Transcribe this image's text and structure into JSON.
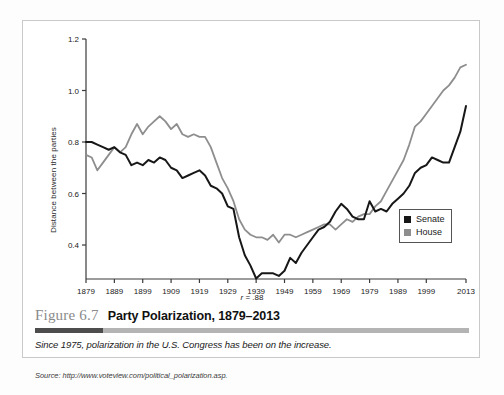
{
  "figure": {
    "number_label": "Figure 6.7",
    "title": "Party Polarization, 1879–2013",
    "subtitle": "Since 1975, polarization in the U.S. Congress has been on the increase.",
    "source": "Source: http://www.voteview.com/political_polarization.asp."
  },
  "legend": {
    "position": "inside-right",
    "items": [
      {
        "label": "Senate",
        "color": "#171717",
        "swatch_name": "senate-swatch"
      },
      {
        "label": "House",
        "color": "#8e8e8e",
        "swatch_name": "house-swatch"
      }
    ]
  },
  "annotation": {
    "correlation_prefix": "r",
    "correlation_equals": "= .88",
    "correlation_text": "r = .88"
  },
  "chart_data": {
    "type": "line",
    "title": "Party Polarization, 1879–2013",
    "subtitle": "Since 1975, polarization in the U.S. Congress has been on the increase.",
    "xlabel": "",
    "ylabel": "Distance between the parties",
    "xlim": [
      1879,
      2013
    ],
    "ylim": [
      0.27,
      1.2
    ],
    "grid": false,
    "legend_position": "inside-right",
    "axis": {
      "y_ticks": [
        0.4,
        0.6,
        0.8,
        1.0,
        1.2
      ],
      "y_tick_labels": [
        "0.4",
        "0.6",
        "0.8",
        "1.0",
        "1.2"
      ],
      "x_ticks": [
        1879,
        1889,
        1899,
        1909,
        1919,
        1929,
        1939,
        1949,
        1959,
        1969,
        1979,
        1989,
        1999,
        2013
      ],
      "x_tick_labels": [
        "1879",
        "1889",
        "1899",
        "1909",
        "1919",
        "1929",
        "1939",
        "1949",
        "1959",
        "1969",
        "1979",
        "1989",
        "1999",
        "2013"
      ]
    },
    "annotations": [
      {
        "text": "r = .88",
        "placement": "below-x-axis-center"
      }
    ],
    "x": [
      1879,
      1881,
      1883,
      1885,
      1887,
      1889,
      1891,
      1893,
      1895,
      1897,
      1899,
      1901,
      1903,
      1905,
      1907,
      1909,
      1911,
      1913,
      1915,
      1917,
      1919,
      1921,
      1923,
      1925,
      1927,
      1929,
      1931,
      1933,
      1935,
      1937,
      1939,
      1941,
      1943,
      1945,
      1947,
      1949,
      1951,
      1953,
      1955,
      1957,
      1959,
      1961,
      1963,
      1965,
      1967,
      1969,
      1971,
      1973,
      1975,
      1977,
      1979,
      1981,
      1983,
      1985,
      1987,
      1989,
      1991,
      1993,
      1995,
      1997,
      1999,
      2001,
      2003,
      2005,
      2007,
      2009,
      2011,
      2013
    ],
    "series": [
      {
        "name": "Senate",
        "color": "#171717",
        "values": [
          0.8,
          0.8,
          0.79,
          0.78,
          0.77,
          0.78,
          0.76,
          0.75,
          0.71,
          0.72,
          0.71,
          0.73,
          0.72,
          0.74,
          0.73,
          0.7,
          0.69,
          0.66,
          0.67,
          0.68,
          0.69,
          0.67,
          0.63,
          0.62,
          0.6,
          0.55,
          0.54,
          0.43,
          0.36,
          0.32,
          0.27,
          0.29,
          0.29,
          0.29,
          0.28,
          0.3,
          0.35,
          0.33,
          0.37,
          0.4,
          0.43,
          0.46,
          0.47,
          0.49,
          0.53,
          0.56,
          0.54,
          0.51,
          0.5,
          0.5,
          0.57,
          0.53,
          0.54,
          0.53,
          0.56,
          0.58,
          0.6,
          0.63,
          0.68,
          0.7,
          0.71,
          0.74,
          0.73,
          0.72,
          0.72,
          0.78,
          0.84,
          0.94
        ]
      },
      {
        "name": "House",
        "color": "#8e8e8e",
        "values": [
          0.75,
          0.74,
          0.69,
          0.72,
          0.75,
          0.78,
          0.76,
          0.78,
          0.83,
          0.87,
          0.83,
          0.86,
          0.88,
          0.9,
          0.88,
          0.85,
          0.87,
          0.83,
          0.82,
          0.83,
          0.82,
          0.82,
          0.78,
          0.72,
          0.66,
          0.62,
          0.57,
          0.5,
          0.46,
          0.44,
          0.43,
          0.43,
          0.42,
          0.44,
          0.41,
          0.44,
          0.44,
          0.43,
          0.44,
          0.45,
          0.46,
          0.47,
          0.48,
          0.48,
          0.46,
          0.48,
          0.5,
          0.49,
          0.51,
          0.52,
          0.52,
          0.55,
          0.57,
          0.61,
          0.65,
          0.69,
          0.73,
          0.79,
          0.86,
          0.88,
          0.91,
          0.94,
          0.97,
          1.0,
          1.02,
          1.05,
          1.09,
          1.1
        ]
      }
    ]
  }
}
